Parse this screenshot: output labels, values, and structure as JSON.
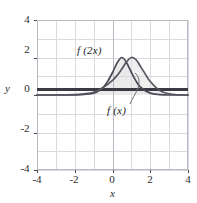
{
  "figure": {
    "axis_label_x": "x",
    "axis_label_y": "y",
    "x_ticks": [
      "-4",
      "-2",
      "0",
      "2",
      "4"
    ],
    "y_ticks": [
      "4",
      "2",
      "0",
      "-2",
      "-4"
    ],
    "curve_label_1": "f (2x)",
    "curve_label_2": "f (x)",
    "colors": {
      "curve": "#4a4a55",
      "axis": "#3a3a42",
      "grid": "#d8d8de",
      "grid_major": "#b6b6c0",
      "fill": "#eeeeee",
      "text": "#2b2b2b"
    }
  },
  "chart_data": {
    "type": "line",
    "title": "",
    "xlabel": "x",
    "ylabel": "y",
    "xlim": [
      -4,
      4
    ],
    "ylim": [
      -4,
      4
    ],
    "xticks": [
      -4,
      -2,
      0,
      2,
      4
    ],
    "yticks": [
      -4,
      -2,
      0,
      2,
      4
    ],
    "grid": true,
    "legend": "inline-annotations",
    "annotations": [
      {
        "text": "f (2x)",
        "x": -0.55,
        "y": 2.85,
        "points_to": [
          0.5,
          2.0
        ]
      },
      {
        "text": "f (x)",
        "x": 0.75,
        "y": -0.95,
        "points_to": [
          1.75,
          0.6
        ]
      }
    ],
    "series": [
      {
        "name": "f (2x)",
        "description": "Bell-shaped curve, peak value 2 at x = 0.5, narrower width",
        "peak_x": 0.5,
        "peak_y": 2.0,
        "x": [
          -4.0,
          -3.0,
          -2.0,
          -1.5,
          -1.0,
          -0.75,
          -0.5,
          -0.25,
          0.0,
          0.25,
          0.5,
          0.75,
          1.0,
          1.25,
          1.5,
          2.0,
          2.5,
          3.0,
          4.0
        ],
        "y": [
          0.0,
          0.0,
          0.01,
          0.03,
          0.1,
          0.21,
          0.4,
          0.74,
          1.2,
          1.72,
          2.0,
          1.72,
          1.2,
          0.74,
          0.4,
          0.1,
          0.02,
          0.0,
          0.0
        ]
      },
      {
        "name": "f (x)",
        "description": "Bell-shaped curve, peak value 2 at x = 1.0, wider width",
        "peak_x": 1.0,
        "peak_y": 2.0,
        "x": [
          -4.0,
          -3.0,
          -2.0,
          -1.5,
          -1.0,
          -0.5,
          0.0,
          0.25,
          0.5,
          0.75,
          1.0,
          1.25,
          1.5,
          1.75,
          2.0,
          2.5,
          3.0,
          3.5,
          4.0
        ],
        "y": [
          0.0,
          0.0,
          0.02,
          0.06,
          0.15,
          0.4,
          0.78,
          1.05,
          1.4,
          1.78,
          2.0,
          1.88,
          1.5,
          1.1,
          0.72,
          0.24,
          0.06,
          0.01,
          0.0
        ]
      }
    ]
  }
}
